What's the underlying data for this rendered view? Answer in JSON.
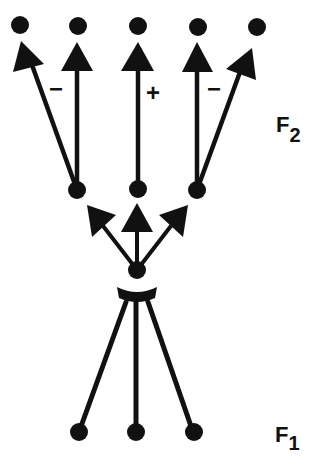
{
  "diagram": {
    "layers": [
      {
        "id": "F1",
        "label": "F",
        "subscript": "1"
      },
      {
        "id": "F2",
        "label": "F",
        "subscript": "2"
      }
    ],
    "signs": {
      "left": "−",
      "center": "+",
      "right": "−"
    },
    "colors": {
      "ink": "#111111",
      "background": "#ffffff"
    }
  }
}
